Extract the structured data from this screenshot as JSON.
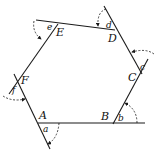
{
  "diagram": {
    "vertices": [
      {
        "id": "A",
        "label": "A"
      },
      {
        "id": "B",
        "label": "B"
      },
      {
        "id": "C",
        "label": "C"
      },
      {
        "id": "D",
        "label": "D"
      },
      {
        "id": "E",
        "label": "E"
      },
      {
        "id": "F",
        "label": "F"
      }
    ],
    "exterior_angles": [
      {
        "vertex": "A",
        "label": "a"
      },
      {
        "vertex": "B",
        "label": "b"
      },
      {
        "vertex": "C",
        "label": "c"
      },
      {
        "vertex": "D",
        "label": "d"
      },
      {
        "vertex": "E",
        "label": "e"
      },
      {
        "vertex": "F",
        "label": "f"
      }
    ],
    "colors": {
      "stroke": "#1a1a1a",
      "background": "#ffffff"
    }
  }
}
